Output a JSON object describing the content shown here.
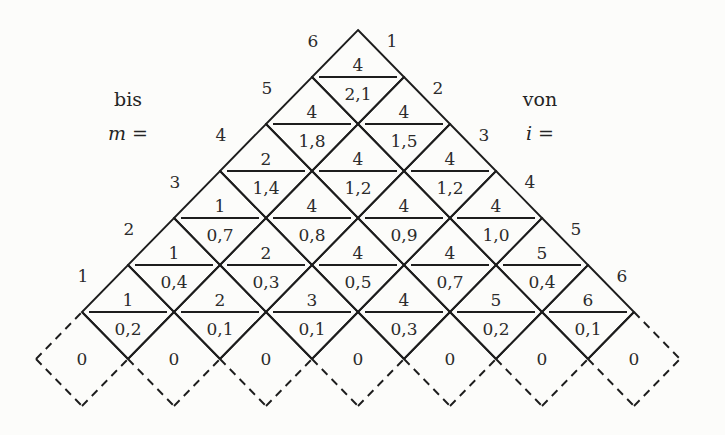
{
  "figure": {
    "left_title": {
      "word": "bis",
      "formula": "m ="
    },
    "right_title": {
      "word": "von",
      "formula": "i ="
    },
    "left_edge_labels": [
      "6",
      "5",
      "4",
      "3",
      "2",
      "1"
    ],
    "right_edge_labels": [
      "1",
      "2",
      "3",
      "4",
      "5",
      "6"
    ],
    "rows": [
      {
        "cells": [
          {
            "top": "4",
            "bottom": "2,1"
          }
        ]
      },
      {
        "cells": [
          {
            "top": "4",
            "bottom": "1,8"
          },
          {
            "top": "4",
            "bottom": "1,5"
          }
        ]
      },
      {
        "cells": [
          {
            "top": "2",
            "bottom": "1,4"
          },
          {
            "top": "4",
            "bottom": "1,2"
          },
          {
            "top": "4",
            "bottom": "1,2"
          }
        ]
      },
      {
        "cells": [
          {
            "top": "1",
            "bottom": "0,7"
          },
          {
            "top": "4",
            "bottom": "0,8"
          },
          {
            "top": "4",
            "bottom": "0,9"
          },
          {
            "top": "4",
            "bottom": "1,0"
          }
        ]
      },
      {
        "cells": [
          {
            "top": "1",
            "bottom": "0,4"
          },
          {
            "top": "2",
            "bottom": "0,3"
          },
          {
            "top": "4",
            "bottom": "0,5"
          },
          {
            "top": "4",
            "bottom": "0,7"
          },
          {
            "top": "5",
            "bottom": "0,4"
          }
        ]
      },
      {
        "cells": [
          {
            "top": "1",
            "bottom": "0,2"
          },
          {
            "top": "2",
            "bottom": "0,1"
          },
          {
            "top": "3",
            "bottom": "0,1"
          },
          {
            "top": "4",
            "bottom": "0,3"
          },
          {
            "top": "5",
            "bottom": "0,2"
          },
          {
            "top": "6",
            "bottom": "0,1"
          }
        ]
      }
    ],
    "base_cells": [
      "0",
      "0",
      "0",
      "0",
      "0",
      "0",
      "0"
    ]
  },
  "colors": {
    "background": "#fcfcfa",
    "line": "#1d1d1d",
    "text": "#2b2b2b"
  }
}
